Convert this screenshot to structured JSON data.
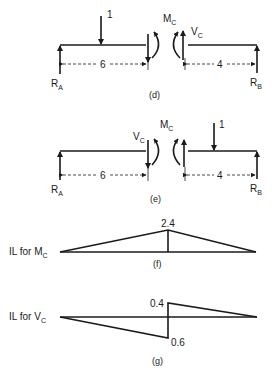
{
  "diagram": {
    "panel_d": {
      "caption": "(d)",
      "load_label": "1",
      "moment_label": "M",
      "moment_sub": "C",
      "shear_label": "V",
      "shear_sub": "C",
      "reaction_left": "R",
      "reaction_left_sub": "A",
      "reaction_right": "R",
      "reaction_right_sub": "B",
      "dim_left": "6",
      "dim_right": "4"
    },
    "panel_e": {
      "caption": "(e)",
      "load_label": "1",
      "moment_label": "M",
      "moment_sub": "C",
      "shear_label": "V",
      "shear_sub": "C",
      "reaction_left": "R",
      "reaction_left_sub": "A",
      "reaction_right": "R",
      "reaction_right_sub": "B",
      "dim_left": "6",
      "dim_right": "4"
    },
    "panel_f": {
      "caption": "(f)",
      "title": "IL for M",
      "title_sub": "C",
      "peak_value": "2.4"
    },
    "panel_g": {
      "caption": "(g)",
      "title": "IL for V",
      "title_sub": "C",
      "positive_value": "0.4",
      "negative_value": "0.6"
    }
  }
}
